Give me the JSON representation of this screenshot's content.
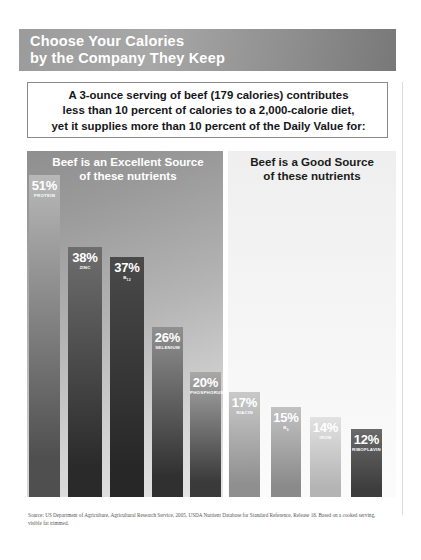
{
  "header": {
    "title": "Choose Your Calories\nby the Company They Keep",
    "accent_color": "#9b9b9b",
    "text_color": "#ffffff"
  },
  "callout": {
    "text": "A 3-ounce serving of beef (179 calories) contributes\nless than 10 percent of calories to a 2,000-calorie diet,\nyet it supplies more than 10 percent of the Daily Value for:",
    "border_color": "#8a8a8a"
  },
  "panels": {
    "left": {
      "title": "Beef is an Excellent Source\nof these nutrients",
      "title_color": "#ffffff"
    },
    "right": {
      "title": "Beef is a Good Source\nof these nutrients",
      "title_color": "#1b1b1b"
    }
  },
  "source": {
    "text": "Source: US Department of Agriculture, Agricultural Research Service, 2005. USDA Nutrient Database for Standard Reference, Release 18. Based on a cooked serving, visible fat trimmed."
  },
  "chart_data": {
    "type": "bar",
    "title": "Choose Your Calories by the Company They Keep",
    "xlabel": "",
    "ylabel": "Percent Daily Value",
    "ylim": [
      0,
      55
    ],
    "grid": false,
    "legend": "none",
    "units": "% Daily Value",
    "categories": [
      "PROTEIN",
      "ZINC",
      "B12",
      "SELENIUM",
      "PHOSPHORUS",
      "NIACIN",
      "B6",
      "IRON",
      "RIBOFLAVIN"
    ],
    "values": [
      51,
      38,
      37,
      26,
      20,
      17,
      15,
      14,
      12
    ],
    "groups": [
      {
        "name": "Beef is an Excellent Source of these nutrients",
        "bars": [
          {
            "pct": "51%",
            "value": 51,
            "nutrient": "PROTEIN",
            "nutrient_html": "PROTEIN",
            "top_color": "#b8b8b8",
            "bottom_color": "#4f4f4f"
          },
          {
            "pct": "38%",
            "value": 38,
            "nutrient": "ZINC",
            "nutrient_html": "ZINC",
            "top_color": "#6e6e6e",
            "bottom_color": "#2a2a2a"
          },
          {
            "pct": "37%",
            "value": 37,
            "nutrient": "B12",
            "nutrient_html": "B<sub>12</sub>",
            "top_color": "#4a4a4a",
            "bottom_color": "#272727"
          },
          {
            "pct": "26%",
            "value": 26,
            "nutrient": "SELENIUM",
            "nutrient_html": "SELENIUM",
            "top_color": "#909090",
            "bottom_color": "#303030"
          },
          {
            "pct": "20%",
            "value": 20,
            "nutrient": "PHOSPHORUS",
            "nutrient_html": "PHOSPHORUS",
            "top_color": "#a8a8a8",
            "bottom_color": "#3a3a3a"
          }
        ]
      },
      {
        "name": "Beef is a Good Source of these nutrients",
        "bars": [
          {
            "pct": "17%",
            "value": 17,
            "nutrient": "NIACIN",
            "nutrient_html": "NIACIN",
            "top_color": "#c9c9c9",
            "bottom_color": "#8f8f8f"
          },
          {
            "pct": "15%",
            "value": 15,
            "nutrient": "B6",
            "nutrient_html": "B<sub>6</sub>",
            "top_color": "#c2c2c2",
            "bottom_color": "#8a8a8a"
          },
          {
            "pct": "14%",
            "value": 14,
            "nutrient": "IRON",
            "nutrient_html": "IRON",
            "top_color": "#e2e2e2",
            "bottom_color": "#b4b4b4"
          },
          {
            "pct": "12%",
            "value": 12,
            "nutrient": "RIBOFLAVIN",
            "nutrient_html": "RIBOFLAVIN",
            "top_color": "#6a6a6a",
            "bottom_color": "#3d3d3d"
          }
        ]
      }
    ]
  },
  "bar_geometry": [
    {
      "left": 29,
      "width": 31,
      "height": 322
    },
    {
      "left": 68,
      "width": 34,
      "height": 250
    },
    {
      "left": 110,
      "width": 34,
      "height": 240
    },
    {
      "left": 152,
      "width": 31,
      "height": 170
    },
    {
      "left": 190,
      "width": 31,
      "height": 125
    },
    {
      "left": 229,
      "width": 31,
      "height": 105
    },
    {
      "left": 271,
      "width": 30,
      "height": 90
    },
    {
      "left": 310,
      "width": 31,
      "height": 80
    },
    {
      "left": 351,
      "width": 31,
      "height": 68
    }
  ]
}
